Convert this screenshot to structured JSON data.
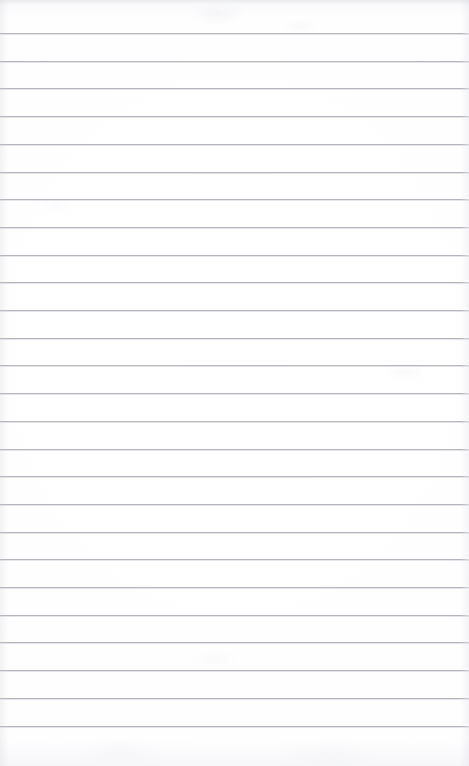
{
  "document": {
    "kind": "lined-notepad-page",
    "title": "Blank Ruled Notepad Page",
    "page_width_px": 469,
    "page_height_px": 766,
    "paper_color": "#ffffff",
    "has_handwriting": false,
    "has_printed_text": false,
    "visible_text": "",
    "orientation": "portrait"
  },
  "ruling": {
    "line_color": "#b4b5bd",
    "line_highlight_color": "#dfe0e6",
    "line_thickness_px": 1,
    "line_spacing_px": 27.7,
    "first_line_y_px": 33,
    "last_line_y_px": 725,
    "line_count": 26,
    "left_inset_px": 0,
    "right_inset_px": 0,
    "has_margin_rule": false,
    "top_margin_px": 33,
    "bottom_margin_px": 41,
    "line_y_positions": [
      33,
      60.7,
      88.4,
      116.1,
      143.8,
      171.5,
      199.2,
      226.9,
      254.6,
      282.3,
      310,
      337.7,
      365.4,
      393.1,
      420.8,
      448.5,
      476.2,
      503.9,
      531.6,
      559.3,
      587,
      614.7,
      642.4,
      670.1,
      697.8,
      725.5
    ]
  },
  "texture": {
    "edge_vignette": true,
    "vignette_color": "#c2c4cc",
    "top_edge_shadow": true,
    "paper_speckle": true
  },
  "content": {
    "lines": []
  }
}
